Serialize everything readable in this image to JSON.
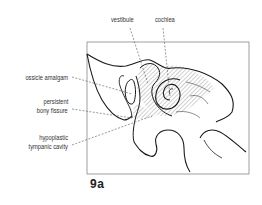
{
  "figure": {
    "number": "9a",
    "labels": {
      "vestibule": "vestibule",
      "cochlea": "cochlea",
      "ossicle_amalgam": "ossicle amalgam",
      "persistent_bony_fissure_line1": "persistent",
      "persistent_bony_fissure_line2": "bony fissure",
      "hypoplastic_tympanic_cavity_line1": "hypoplastic",
      "hypoplastic_tympanic_cavity_line2": "tympanic cavity"
    }
  },
  "colors": {
    "outline": "#1a1a1a",
    "frame": "#888888",
    "leader": "#555555",
    "hatch": "#777777"
  }
}
